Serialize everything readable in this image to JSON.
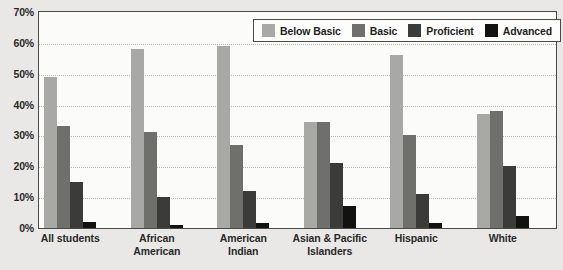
{
  "chart_data": {
    "type": "bar",
    "title": "",
    "subtitle": "",
    "xlabel": "",
    "ylabel": "",
    "ylim": [
      0,
      70
    ],
    "ytick_labels": [
      "0%",
      "10%",
      "20%",
      "30%",
      "40%",
      "50%",
      "60%",
      "70%"
    ],
    "ytick_values": [
      0,
      10,
      20,
      30,
      40,
      50,
      60,
      70
    ],
    "grid": true,
    "legend_position": "top-right",
    "categories": [
      "All students",
      "African American",
      "American Indian",
      "Asian & Pacific Islanders",
      "Hispanic",
      "White"
    ],
    "category_label_lines": [
      [
        "All students"
      ],
      [
        "African",
        "American"
      ],
      [
        "American",
        "Indian"
      ],
      [
        "Asian & Pacific",
        "Islanders"
      ],
      [
        "Hispanic"
      ],
      [
        "White"
      ]
    ],
    "series": [
      {
        "name": "Below Basic",
        "color": "#a8a9a4",
        "values": [
          49,
          58,
          59,
          34.5,
          56,
          37
        ]
      },
      {
        "name": "Basic",
        "color": "#6f706c",
        "values": [
          33,
          31,
          27,
          34.5,
          30,
          38
        ]
      },
      {
        "name": "Proficient",
        "color": "#3b3c3a",
        "values": [
          15,
          10,
          12,
          21,
          11,
          20
        ]
      },
      {
        "name": "Advanced",
        "color": "#121211",
        "values": [
          2,
          1,
          1.5,
          7,
          1.5,
          4
        ]
      }
    ]
  },
  "legend": {
    "items": [
      {
        "label": "Below Basic",
        "color": "#a8a9a4"
      },
      {
        "label": "Basic",
        "color": "#6f706c"
      },
      {
        "label": "Proficient",
        "color": "#3b3c3a"
      },
      {
        "label": "Advanced",
        "color": "#121211"
      }
    ]
  },
  "colors": {
    "background": "#e9e8e6",
    "plot_background": "#fbfbfa",
    "axis": "#4a4a48",
    "gridline": "#b8b7b3",
    "text": "#2a2a29"
  }
}
